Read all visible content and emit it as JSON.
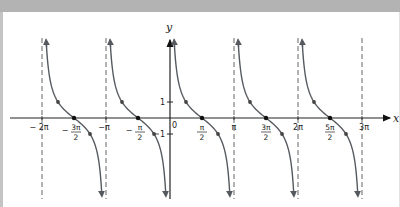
{
  "chart_data": {
    "type": "line",
    "function": "y = cot x",
    "title": "",
    "xlabel": "x",
    "ylabel": "y",
    "origin_label": "0",
    "x_tick_labels": [
      "-2π",
      "-3π/2",
      "-π",
      "-π/2",
      "π/2",
      "π",
      "3π/2",
      "2π",
      "5π/2",
      "3π"
    ],
    "y_tick_labels": [
      "1",
      "-1"
    ],
    "asymptotes": [
      "-2π",
      "-π",
      "0",
      "π",
      "2π",
      "3π"
    ],
    "xlim": [
      "-2π",
      "3π"
    ],
    "ylim": [
      -4.9,
      4.9
    ],
    "grid": false,
    "legend": "none",
    "series": [
      {
        "name": "branch (-2π,-π)",
        "marked_points": [
          [
            "-7π/4",
            1
          ],
          [
            "-3π/2",
            0
          ],
          [
            "-5π/4",
            -1
          ]
        ]
      },
      {
        "name": "branch (-π,0)",
        "marked_points": [
          [
            "-3π/4",
            1
          ],
          [
            "-π/2",
            0
          ],
          [
            "-π/4",
            -1
          ]
        ]
      },
      {
        "name": "branch (0,π)",
        "marked_points": [
          [
            "π/4",
            1
          ],
          [
            "π/2",
            0
          ],
          [
            "3π/4",
            -1
          ]
        ]
      },
      {
        "name": "branch (π,2π)",
        "marked_points": [
          [
            "5π/4",
            1
          ],
          [
            "3π/2",
            0
          ],
          [
            "7π/4",
            -1
          ]
        ]
      },
      {
        "name": "branch (2π,3π)",
        "marked_points": [
          [
            "9π/4",
            1
          ],
          [
            "5π/2",
            0
          ],
          [
            "11π/4",
            -1
          ]
        ]
      }
    ],
    "colors": {
      "curve": "#555a60",
      "axis": "#222222",
      "asymptote": "#666666",
      "point": "#444444"
    }
  },
  "labels": {
    "x_axis": "x",
    "y_axis": "y",
    "origin": "0",
    "y_one": "1",
    "y_minus_one": "1"
  }
}
